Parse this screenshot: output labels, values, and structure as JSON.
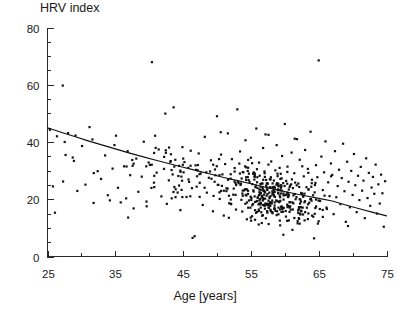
{
  "chart_data": {
    "type": "scatter",
    "title": "HRV index",
    "xlabel": "Age [years]",
    "ylabel": "HRV index",
    "grid": false,
    "legend": "none",
    "xlim": [
      25,
      75
    ],
    "ylim": [
      0,
      80
    ],
    "xticks": [
      25,
      35,
      45,
      55,
      65,
      75
    ],
    "xtick_labels": [
      "25",
      "35",
      "45",
      "55",
      "65",
      "75"
    ],
    "xminor_step": 5,
    "yticks": [
      0,
      20,
      40,
      60,
      80
    ],
    "ytick_labels": [
      "0",
      "20",
      "40",
      "60",
      "80"
    ],
    "yminor_step": 5,
    "marker": "square",
    "marker_size_px": 2.2,
    "marker_color": "#111111",
    "n_points": 601,
    "fit": {
      "type": "exponential-decay-trend",
      "label": "regression curve",
      "color": "#111111",
      "x": [
        25,
        27,
        29,
        31,
        33,
        35,
        37,
        39,
        41,
        43,
        45,
        47,
        49,
        51,
        53,
        55,
        57,
        59,
        61,
        63,
        65,
        67,
        69,
        71,
        73,
        75
      ],
      "y": [
        45.0,
        43.4,
        41.9,
        40.4,
        39.0,
        37.6,
        36.2,
        34.9,
        33.6,
        32.4,
        31.2,
        30.0,
        28.8,
        27.6,
        26.5,
        25.4,
        24.3,
        23.2,
        22.2,
        21.2,
        20.3,
        19.4,
        18.0,
        16.7,
        15.4,
        14.2
      ]
    },
    "points": [
      [
        25.8,
        24.5
      ],
      [
        26.1,
        15.3
      ],
      [
        26.4,
        42.0
      ],
      [
        27.3,
        26.2
      ],
      [
        28.9,
        33.4
      ],
      [
        29.4,
        22.9
      ],
      [
        30.1,
        38.6
      ],
      [
        30.6,
        25.1
      ],
      [
        31.2,
        45.2
      ],
      [
        31.8,
        18.7
      ],
      [
        32.4,
        29.8
      ],
      [
        32.9,
        27.1
      ],
      [
        33.5,
        35.3
      ],
      [
        33.9,
        21.4
      ],
      [
        34.2,
        19.6
      ],
      [
        34.6,
        30.7
      ],
      [
        35.1,
        42.2
      ],
      [
        35.4,
        24.0
      ],
      [
        35.8,
        18.9
      ],
      [
        36.3,
        31.5
      ],
      [
        36.6,
        20.3
      ],
      [
        36.9,
        13.6
      ],
      [
        37.2,
        28.4
      ],
      [
        37.7,
        16.8
      ],
      [
        38.1,
        34.2
      ],
      [
        38.4,
        22.6
      ],
      [
        38.9,
        27.9
      ],
      [
        39.2,
        40.1
      ],
      [
        39.6,
        19.2
      ],
      [
        40.1,
        32.0
      ],
      [
        40.4,
        67.9
      ],
      [
        40.7,
        25.8
      ],
      [
        41.1,
        29.3
      ],
      [
        41.4,
        37.4
      ],
      [
        41.8,
        21.0
      ],
      [
        42.2,
        34.8
      ],
      [
        42.6,
        18.4
      ],
      [
        42.9,
        26.6
      ],
      [
        43.3,
        30.2
      ],
      [
        43.6,
        52.1
      ],
      [
        43.9,
        23.5
      ],
      [
        44.3,
        28.1
      ],
      [
        44.6,
        16.2
      ],
      [
        44.9,
        38.2
      ],
      [
        45.2,
        33.0
      ],
      [
        45.5,
        20.8
      ],
      [
        45.8,
        26.9
      ],
      [
        46.1,
        31.7
      ],
      [
        46.4,
        6.5
      ],
      [
        46.7,
        7.1
      ],
      [
        47.0,
        24.4
      ],
      [
        47.3,
        36.0
      ],
      [
        47.6,
        29.0
      ],
      [
        47.9,
        18.0
      ],
      [
        48.2,
        41.8
      ],
      [
        48.5,
        22.3
      ],
      [
        48.8,
        27.5
      ],
      [
        49.1,
        33.6
      ],
      [
        49.4,
        15.8
      ],
      [
        49.7,
        30.4
      ],
      [
        50.0,
        49.0
      ],
      [
        50.2,
        25.0
      ],
      [
        50.4,
        20.1
      ],
      [
        50.6,
        35.6
      ],
      [
        50.8,
        28.7
      ],
      [
        51.0,
        14.3
      ],
      [
        51.2,
        32.3
      ],
      [
        51.4,
        23.8
      ],
      [
        51.6,
        43.0
      ],
      [
        51.8,
        18.6
      ],
      [
        52.0,
        27.2
      ],
      [
        52.2,
        34.0
      ],
      [
        52.4,
        21.6
      ],
      [
        52.6,
        30.9
      ],
      [
        52.8,
        16.4
      ],
      [
        53.0,
        51.4
      ],
      [
        53.2,
        25.6
      ],
      [
        53.4,
        36.7
      ],
      [
        53.6,
        19.8
      ],
      [
        53.8,
        29.5
      ],
      [
        54.0,
        23.1
      ],
      [
        54.2,
        40.6
      ],
      [
        54.4,
        13.0
      ],
      [
        54.6,
        31.0
      ],
      [
        54.8,
        26.0
      ],
      [
        55.0,
        34.5
      ],
      [
        55.2,
        17.9
      ],
      [
        55.4,
        22.7
      ],
      [
        55.6,
        28.3
      ],
      [
        55.8,
        44.7
      ],
      [
        56.0,
        20.5
      ],
      [
        56.2,
        32.8
      ],
      [
        56.4,
        25.3
      ],
      [
        56.6,
        11.7
      ],
      [
        56.8,
        37.9
      ],
      [
        57.0,
        29.7
      ],
      [
        57.2,
        18.2
      ],
      [
        57.4,
        23.4
      ],
      [
        57.6,
        42.5
      ],
      [
        57.8,
        27.0
      ],
      [
        58.0,
        33.2
      ],
      [
        58.2,
        15.1
      ],
      [
        58.4,
        21.2
      ],
      [
        58.6,
        30.1
      ],
      [
        58.8,
        38.9
      ],
      [
        59.0,
        24.8
      ],
      [
        59.2,
        19.0
      ],
      [
        59.4,
        28.9
      ],
      [
        59.6,
        35.1
      ],
      [
        59.8,
        22.0
      ],
      [
        60.0,
        46.3
      ],
      [
        60.2,
        26.4
      ],
      [
        60.4,
        31.4
      ],
      [
        60.6,
        12.6
      ],
      [
        60.8,
        17.5
      ],
      [
        61.0,
        36.3
      ],
      [
        61.2,
        23.9
      ],
      [
        61.4,
        29.1
      ],
      [
        61.6,
        20.0
      ],
      [
        61.8,
        41.0
      ],
      [
        62.0,
        25.5
      ],
      [
        62.2,
        33.8
      ],
      [
        62.4,
        16.0
      ],
      [
        62.6,
        21.8
      ],
      [
        62.8,
        28.0
      ],
      [
        63.0,
        37.2
      ],
      [
        63.2,
        24.2
      ],
      [
        63.4,
        30.6
      ],
      [
        63.6,
        18.8
      ],
      [
        63.8,
        43.6
      ],
      [
        64.0,
        26.8
      ],
      [
        64.2,
        13.9
      ],
      [
        64.4,
        22.4
      ],
      [
        64.6,
        31.9
      ],
      [
        64.8,
        27.7
      ],
      [
        65.0,
        68.5
      ],
      [
        65.2,
        19.4
      ],
      [
        65.4,
        34.9
      ],
      [
        65.6,
        23.2
      ],
      [
        65.8,
        29.4
      ],
      [
        66.0,
        40.2
      ],
      [
        66.2,
        16.6
      ],
      [
        66.4,
        25.9
      ],
      [
        66.6,
        21.1
      ],
      [
        66.8,
        32.5
      ],
      [
        67.0,
        28.5
      ],
      [
        67.2,
        14.8
      ],
      [
        67.4,
        36.8
      ],
      [
        67.6,
        20.7
      ],
      [
        67.8,
        24.6
      ],
      [
        68.0,
        30.3
      ],
      [
        68.2,
        18.3
      ],
      [
        68.4,
        27.4
      ],
      [
        68.6,
        39.4
      ],
      [
        68.8,
        22.8
      ],
      [
        69.0,
        12.1
      ],
      [
        69.2,
        33.1
      ],
      [
        69.4,
        26.1
      ],
      [
        69.6,
        17.2
      ],
      [
        69.8,
        29.9
      ],
      [
        70.0,
        21.5
      ],
      [
        70.2,
        35.8
      ],
      [
        70.4,
        24.9
      ],
      [
        70.6,
        15.5
      ],
      [
        70.8,
        28.2
      ],
      [
        71.0,
        19.7
      ],
      [
        71.2,
        31.3
      ],
      [
        71.4,
        23.0
      ],
      [
        71.6,
        26.5
      ],
      [
        71.8,
        13.4
      ],
      [
        72.0,
        34.3
      ],
      [
        72.2,
        20.4
      ],
      [
        72.4,
        29.2
      ],
      [
        72.6,
        17.7
      ],
      [
        72.8,
        24.1
      ],
      [
        73.0,
        27.8
      ],
      [
        73.2,
        21.9
      ],
      [
        73.4,
        32.1
      ],
      [
        73.6,
        15.0
      ],
      [
        73.8,
        25.2
      ],
      [
        74.0,
        18.5
      ],
      [
        74.2,
        28.6
      ],
      [
        74.4,
        22.1
      ],
      [
        74.6,
        10.4
      ],
      [
        74.8,
        26.3
      ]
    ]
  },
  "figure": {
    "background": "#ffffff",
    "axis_color": "#2a2a2a",
    "marker_color": "#111111"
  }
}
